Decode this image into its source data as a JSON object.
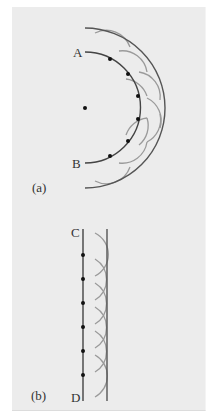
{
  "figure": {
    "panel_a": {
      "caption": "(a)",
      "label_start": "A",
      "label_end": "B",
      "wave_type": "spherical"
    },
    "panel_b": {
      "caption": "(b)",
      "label_start": "C",
      "label_end": "D",
      "wave_type": "plane"
    },
    "colors": {
      "background": "#ececec",
      "wavefront": "#555555",
      "wavelet": "#9a9a9a",
      "point": "#111111"
    }
  }
}
